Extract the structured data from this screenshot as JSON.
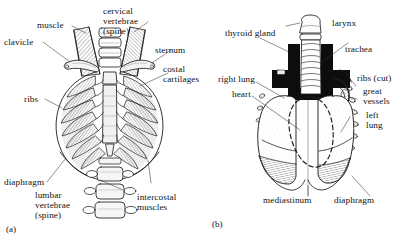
{
  "figure": {
    "type": "anatomical-line-drawing",
    "background_color": "#ffffff",
    "ink_color": "#1a1a1a",
    "panel_count": 2
  },
  "panels": [
    {
      "id": "(a)",
      "name": "anterior-thoracic-cage",
      "description": "Anterior view of the bony thorax showing clavicles, sternum, ribs, costal cartilages, vertebrae and associated muscles"
    },
    {
      "id": "(b)",
      "name": "thoracic-contents",
      "description": "Anterior view of thoracic contents showing larynx, trachea, thyroid gland, lungs, heart, great vessels and diaphragm"
    }
  ],
  "labels_a": [
    {
      "key": "muscle",
      "text": "muscle"
    },
    {
      "key": "cervical",
      "text": "cervical\nvertebrae\n(spine)"
    },
    {
      "key": "clavicle",
      "text": "clavicle"
    },
    {
      "key": "sternum",
      "text": "sternum"
    },
    {
      "key": "costal_cartilages",
      "text": "costal\ncartilages"
    },
    {
      "key": "ribs",
      "text": "ribs"
    },
    {
      "key": "diaphragm",
      "text": "diaphragm"
    },
    {
      "key": "lumbar",
      "text": "lumbar\nvertebrae\n(spine)"
    },
    {
      "key": "intercostal",
      "text": "intercostal\nmuscles"
    }
  ],
  "labels_b": [
    {
      "key": "thyroid_gland",
      "text": "thyroid gland"
    },
    {
      "key": "larynx",
      "text": "larynx"
    },
    {
      "key": "trachea",
      "text": "trachea"
    },
    {
      "key": "right_lung",
      "text": "right lung"
    },
    {
      "key": "heart",
      "text": "heart"
    },
    {
      "key": "ribs_cut",
      "text": "ribs (cut)"
    },
    {
      "key": "great_vessels",
      "text": "great\nvessels"
    },
    {
      "key": "left_lung",
      "text": "left\nlung"
    },
    {
      "key": "mediastinum",
      "text": "mediastinum"
    },
    {
      "key": "diaphragm",
      "text": "diaphragm"
    }
  ]
}
